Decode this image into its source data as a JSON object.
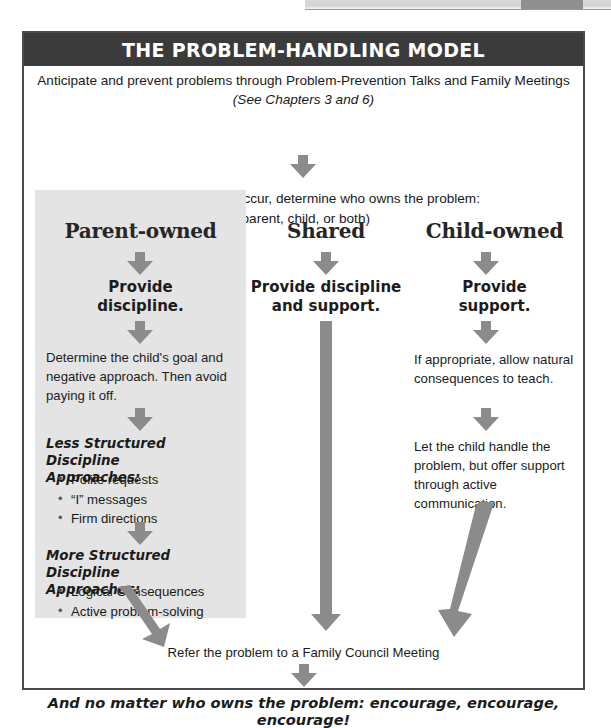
{
  "figure": {
    "title": "THE PROBLEM-HANDLING MODEL",
    "intro_line1": "Anticipate and prevent problems through Problem-Prevention Talks and Family Meetings",
    "intro_line2": "(See Chapters 3 and 6)",
    "question_line1": "If a problem does occur, determine who owns the problem:",
    "question_line2": "(parent, child, or both)",
    "bottom_text": "Refer the problem to a Family Council Meeting",
    "final_text": "And no matter who owns the problem:  encourage, encourage, encourage!"
  },
  "columns": {
    "parent": {
      "heading": "Parent-owned",
      "action": "Provide\ndiscipline.",
      "action_line1": "Provide",
      "action_line2": "discipline.",
      "step1": "Determine the child's goal and negative approach. Then avoid paying it off.",
      "subhead1_line1": "Less Structured Discipline",
      "subhead1_line2": "Approaches:",
      "bullets1": [
        "Polite requests",
        "“I” messages",
        "Firm directions"
      ],
      "subhead2_line1": "More Structured Discipline",
      "subhead2_line2": "Approaches:",
      "bullets2": [
        "Logical Consequences",
        "Active problem-solving"
      ]
    },
    "shared": {
      "heading": "Shared",
      "action_line1": "Provide discipline",
      "action_line2": "and support."
    },
    "child": {
      "heading": "Child-owned",
      "action_line1": "Provide",
      "action_line2": "support.",
      "step1": "If appropriate, allow natural consequences to teach.",
      "step2": "Let the child handle the problem, but offer support through active communication."
    }
  },
  "colors": {
    "title_bar": "#3b3b3b",
    "panel_grey": "#e4e4e4",
    "arrow_grey": "#8b8b8b",
    "border": "#4a4a4a",
    "text": "#1c1c1c"
  },
  "icons": {
    "arrow_down": "down-arrow-icon",
    "arrow_long": "long-down-arrow-icon",
    "arrow_diagonal": "diagonal-down-arrow-icon"
  }
}
